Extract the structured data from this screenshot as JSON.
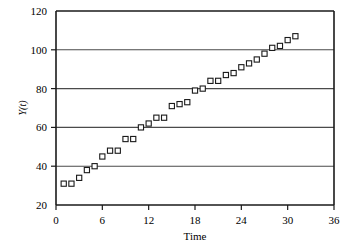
{
  "chart_data": {
    "type": "scatter",
    "title": "",
    "xlabel": "Time",
    "ylabel": "Y(t)",
    "xlim": [
      0,
      36
    ],
    "ylim": [
      20,
      120
    ],
    "xticks": [
      0,
      6,
      12,
      18,
      24,
      30,
      36
    ],
    "yticks": [
      20,
      40,
      60,
      80,
      100,
      120
    ],
    "xtick_labels": [
      "0",
      "6",
      "12",
      "18",
      "24",
      "30",
      "36"
    ],
    "ytick_labels": [
      "20",
      "40",
      "60",
      "80",
      "100",
      "120"
    ],
    "grid": "horizontal",
    "legend": "none",
    "marker": "open-square",
    "marker_color": "#1a1a1a",
    "marker_fill": "#ffffff",
    "series": [
      {
        "name": "Y(t)",
        "x": [
          1,
          2,
          3,
          4,
          5,
          6,
          7,
          8,
          9,
          10,
          11,
          12,
          13,
          14,
          15,
          16,
          17,
          18,
          19,
          20,
          21,
          22,
          23,
          24,
          25,
          26,
          27,
          28,
          29,
          30,
          31
        ],
        "y": [
          31,
          31,
          34,
          38,
          40,
          45,
          48,
          48,
          54,
          54,
          60,
          62,
          65,
          65,
          71,
          72,
          73,
          79,
          80,
          84,
          84,
          87,
          88,
          91,
          93,
          95,
          98,
          101,
          102,
          105,
          107
        ]
      }
    ]
  },
  "axes": {
    "x_axis_name": "Time",
    "y_axis_name": "Y(t)"
  }
}
